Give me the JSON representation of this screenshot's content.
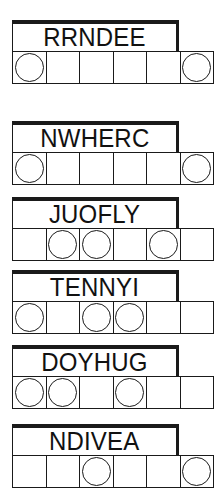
{
  "sheet": {
    "title": "Word Scramble Puzzle Sheet",
    "puzzle_count": 6,
    "letters_per_word": 6,
    "ink_color": "#1a1a1a",
    "paper_color": "#ffffff"
  },
  "puzzles": [
    {
      "id": "puzzle-1",
      "scrambled_word": "RRNDEE",
      "letter_count": 6,
      "circled_positions": [
        1,
        6
      ],
      "cells": [
        "",
        "",
        "",
        "",
        "",
        ""
      ]
    },
    {
      "id": "puzzle-2",
      "scrambled_word": "NWHERC",
      "letter_count": 6,
      "circled_positions": [
        1,
        6
      ],
      "cells": [
        "",
        "",
        "",
        "",
        "",
        ""
      ]
    },
    {
      "id": "puzzle-3",
      "scrambled_word": "JUOFLY",
      "letter_count": 6,
      "circled_positions": [
        2,
        3,
        5
      ],
      "cells": [
        "",
        "",
        "",
        "",
        "",
        ""
      ]
    },
    {
      "id": "puzzle-4",
      "scrambled_word": "TENNYI",
      "letter_count": 6,
      "circled_positions": [
        1,
        3,
        4
      ],
      "cells": [
        "",
        "",
        "",
        "",
        "",
        ""
      ]
    },
    {
      "id": "puzzle-5",
      "scrambled_word": "DOYHUG",
      "letter_count": 6,
      "circled_positions": [
        1,
        2,
        4
      ],
      "cells": [
        "",
        "",
        "",
        "",
        "",
        ""
      ]
    },
    {
      "id": "puzzle-6",
      "scrambled_word": "NDIVEA",
      "letter_count": 6,
      "circled_positions": [
        3,
        6
      ],
      "cells": [
        "",
        "",
        "",
        "",
        "",
        ""
      ]
    }
  ],
  "layout": {
    "puzzle_tops": [
      20,
      121,
      197,
      270,
      345,
      424
    ]
  }
}
